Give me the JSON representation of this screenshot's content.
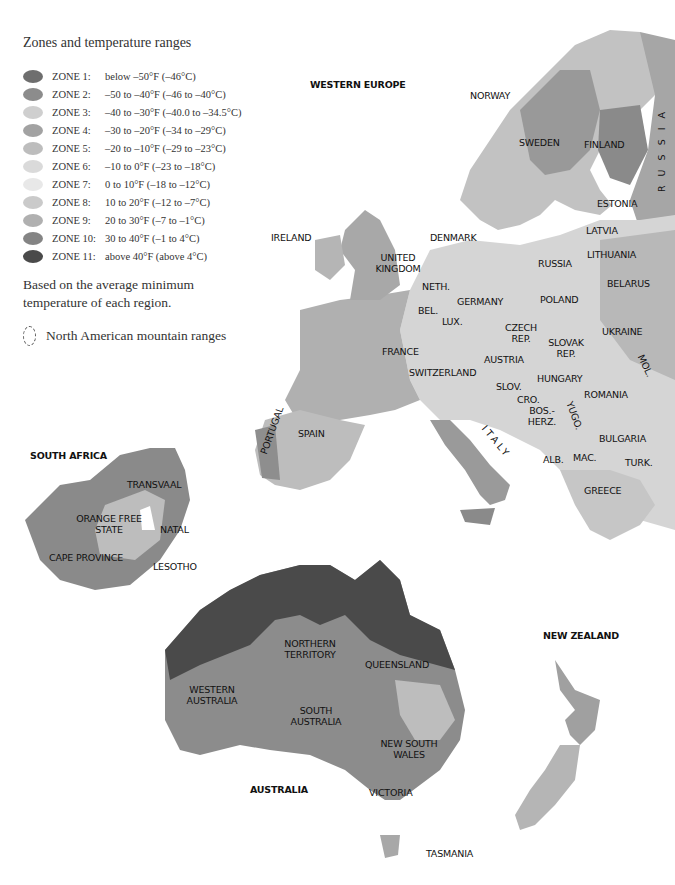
{
  "legend": {
    "title": "Zones and temperature ranges",
    "zones": [
      {
        "name": "ZONE 1:",
        "range": "below –50°F (–46°C)",
        "color": "#6e6e6e"
      },
      {
        "name": "ZONE 2:",
        "range": "–50 to –40°F (–46 to –40°C)",
        "color": "#8c8c8c"
      },
      {
        "name": "ZONE 3:",
        "range": "–40 to –30°F (–40.0 to –34.5°C)",
        "color": "#cfcfcf"
      },
      {
        "name": "ZONE 4:",
        "range": "–30 to –20°F (–34 to –29°C)",
        "color": "#a2a2a2"
      },
      {
        "name": "ZONE 5:",
        "range": "–20 to –10°F (–29 to –23°C)",
        "color": "#bdbdbd"
      },
      {
        "name": "ZONE 6:",
        "range": "–10 to 0°F (–23 to –18°C)",
        "color": "#dadada"
      },
      {
        "name": "ZONE 7:",
        "range": "0 to 10°F (–18 to –12°C)",
        "color": "#e8e8e8"
      },
      {
        "name": "ZONE 8:",
        "range": "10 to 20°F (–12 to –7°C)",
        "color": "#cacaca"
      },
      {
        "name": "ZONE 9:",
        "range": "20 to 30°F (–7 to –1°C)",
        "color": "#b0b0b0"
      },
      {
        "name": "ZONE 10:",
        "range": "30 to 40°F (–1 to 4°C)",
        "color": "#848484"
      },
      {
        "name": "ZONE 11:",
        "range": "above 40°F (above 4°C)",
        "color": "#4a4a4a"
      }
    ],
    "note": "Based on the average minimum temperature of each region.",
    "mountain_label": "North American mountain ranges"
  },
  "regions": {
    "western_europe": {
      "title": "WESTERN EUROPE",
      "labels": [
        "NORWAY",
        "SWEDEN",
        "FINLAND",
        "R U S S I A",
        "ESTONIA",
        "LATVIA",
        "LITHUANIA",
        "IRELAND",
        "DENMARK",
        "UNITED KINGDOM",
        "RUSSIA",
        "BELARUS",
        "NETH.",
        "GERMANY",
        "POLAND",
        "BEL.",
        "LUX.",
        "CZECH REP.",
        "UKRAINE",
        "SLOVAK REP.",
        "FRANCE",
        "AUSTRIA",
        "MOL.",
        "SWITZERLAND",
        "HUNGARY",
        "SLOV.",
        "ROMANIA",
        "CRO.",
        "BOS.-HERZ.",
        "YUGO.",
        "PORTUGAL",
        "SPAIN",
        "ITALY",
        "BULGARIA",
        "ALB.",
        "MAC.",
        "TURK.",
        "GREECE"
      ]
    },
    "south_africa": {
      "title": "SOUTH AFRICA",
      "labels": [
        "TRANSVAAL",
        "ORANGE FREE STATE",
        "NATAL",
        "CAPE PROVINCE",
        "LESOTHO"
      ]
    },
    "australia": {
      "title": "AUSTRALIA",
      "labels": [
        "NORTHERN TERRITORY",
        "QUEENSLAND",
        "WESTERN AUSTRALIA",
        "SOUTH AUSTRALIA",
        "NEW SOUTH WALES",
        "VICTORIA",
        "TASMANIA"
      ]
    },
    "new_zealand": {
      "title": "NEW ZEALAND"
    }
  }
}
